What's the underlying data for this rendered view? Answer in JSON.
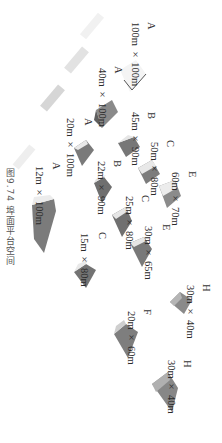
{
  "caption": "图9.74 埠面平台空间",
  "orientation": "rotated 90° clockwise",
  "colors": {
    "shape_dark": "#6e6e6e",
    "shape_mid": "#9a9a9a",
    "shape_light": "#e4e4e4",
    "stripe_light": "#dcdcdc",
    "stripe_faint": "#efefef",
    "text": "#2b2b2b"
  },
  "platforms": [
    {
      "type": "A",
      "size": "100m × 100m"
    },
    {
      "type": "A",
      "size": "40m × 100m"
    },
    {
      "type": "A",
      "size": "20m × 100m"
    },
    {
      "type": "A",
      "size": "12m × 100m"
    },
    {
      "type": "B",
      "size": "45m × 90m"
    },
    {
      "type": "B",
      "size": "22m × 90m"
    },
    {
      "type": "C",
      "size": "50m × 80m"
    },
    {
      "type": "C",
      "size": "25m × 80m"
    },
    {
      "type": "C",
      "size": "15m × 80m"
    },
    {
      "type": "E",
      "size": "60m × 70m"
    },
    {
      "type": "E",
      "size": "30m × 65m"
    },
    {
      "type": "F",
      "size": "20m × 60m"
    },
    {
      "type": "H",
      "size": "30m × 40m"
    },
    {
      "type": "H",
      "size": "30m × 40m"
    }
  ]
}
